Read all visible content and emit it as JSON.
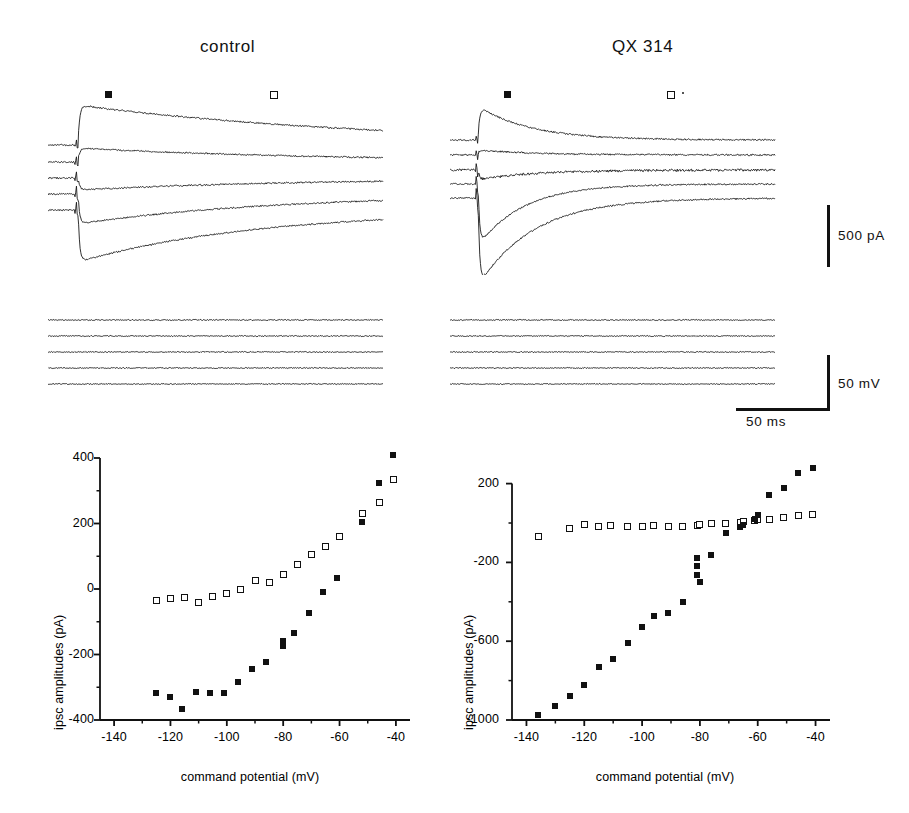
{
  "figure": {
    "cut_header_text": "",
    "panels": [
      {
        "id": "control",
        "title": "control"
      },
      {
        "id": "qx314",
        "title": "QX 314"
      }
    ],
    "markers": {
      "filled_label": "filled-square-marker",
      "open_label": "open-square-marker"
    },
    "scalebars": [
      {
        "name": "current-scalebar",
        "label": "500 pA",
        "orientation": "vertical"
      },
      {
        "name": "voltage-scalebar",
        "label": "50 mV",
        "orientation": "vertical"
      },
      {
        "name": "time-scalebar",
        "label": "50 ms",
        "orientation": "horizontal"
      }
    ]
  },
  "chart_data": [
    {
      "type": "scatter",
      "panel": "control",
      "title": "control",
      "xlabel": "command potential (mV)",
      "ylabel": "ipsc amplitudes (pA)",
      "xlim": [
        -145,
        -35
      ],
      "ylim": [
        -400,
        400
      ],
      "xticks": [
        -140,
        -120,
        -100,
        -80,
        -60,
        -40
      ],
      "xticklabels": [
        "-140",
        "-120",
        "-100",
        "-80",
        "-60",
        "-40"
      ],
      "yticks": [
        -400,
        -200,
        0,
        200,
        400
      ],
      "yticklabels": [
        "-400",
        "-200",
        "0",
        "200",
        "400"
      ],
      "yminorticks": [
        -300,
        -100,
        100,
        300
      ],
      "xminorticks": [
        -130,
        -110,
        -90,
        -70,
        -50
      ],
      "grid": false,
      "legend": false,
      "series": [
        {
          "name": "open-square-series",
          "marker": "open square",
          "x": [
            -125,
            -120,
            -115,
            -110,
            -105,
            -100,
            -95,
            -90,
            -85,
            -80,
            -75,
            -70,
            -65,
            -60,
            -52,
            -46,
            -41
          ],
          "y": [
            -35,
            -28,
            -25,
            -40,
            -22,
            -15,
            0,
            25,
            20,
            45,
            75,
            105,
            130,
            160,
            230,
            265,
            333
          ]
        },
        {
          "name": "filled-square-series",
          "marker": "filled square",
          "x": [
            -125,
            -120,
            -116,
            -111,
            -106,
            -101,
            -96,
            -91,
            -86,
            -80,
            -80,
            -76,
            -71,
            -66,
            -61,
            -52,
            -46,
            -41
          ],
          "y": [
            -318,
            -330,
            -365,
            -315,
            -318,
            -317,
            -285,
            -245,
            -222,
            -160,
            -175,
            -133,
            -73,
            -10,
            35,
            205,
            325,
            408
          ]
        }
      ]
    },
    {
      "type": "scatter",
      "panel": "qx314",
      "title": "QX 314",
      "xlabel": "command potential (mV)",
      "ylabel": "ipsc amplitudes (pA)",
      "xlim": [
        -145,
        -35
      ],
      "ylim": [
        -1000,
        330
      ],
      "xticks": [
        -140,
        -120,
        -100,
        -80,
        -60,
        -40
      ],
      "xticklabels": [
        "-140",
        "-120",
        "-100",
        "-80",
        "-60",
        "-40"
      ],
      "yticks": [
        -1000,
        -600,
        -200,
        200
      ],
      "yticklabels": [
        "-1000",
        "-600",
        "-200",
        "200"
      ],
      "yminorticks": [
        -800,
        -400,
        0
      ],
      "xminorticks": [
        -130,
        -110,
        -90,
        -70,
        -50
      ],
      "grid": false,
      "legend": false,
      "series": [
        {
          "name": "open-square-series",
          "marker": "open square",
          "x": [
            -136,
            -125,
            -120,
            -115,
            -111,
            -105,
            -100,
            -96,
            -91,
            -86,
            -81,
            -80,
            -76,
            -71,
            -66,
            -65,
            -61,
            -60,
            -56,
            -51,
            -46,
            -41
          ],
          "y": [
            -70,
            -30,
            -10,
            -18,
            -15,
            -20,
            -18,
            -15,
            -20,
            -18,
            -12,
            -8,
            0,
            0,
            5,
            8,
            15,
            20,
            18,
            28,
            38,
            45
          ]
        },
        {
          "name": "filled-square-series",
          "marker": "filled square",
          "x": [
            -136,
            -130,
            -125,
            -120,
            -115,
            -110,
            -105,
            -100,
            -96,
            -91,
            -86,
            -81,
            -81,
            -81,
            -80,
            -76,
            -71,
            -66,
            -65,
            -61,
            -60,
            -56,
            -51,
            -46,
            -41
          ],
          "y": [
            -975,
            -930,
            -880,
            -820,
            -730,
            -690,
            -610,
            -530,
            -470,
            -455,
            -400,
            -265,
            -220,
            -180,
            -300,
            -160,
            -50,
            -20,
            -8,
            20,
            40,
            140,
            180,
            255,
            280
          ]
        }
      ]
    }
  ],
  "traces": {
    "control_current": {
      "name": "control-current-traces",
      "n_traces": 5
    },
    "qx_current": {
      "name": "qx314-current-traces",
      "n_traces": 5
    },
    "control_voltage": {
      "name": "control-voltage-traces",
      "n_traces": 5
    },
    "qx_voltage": {
      "name": "qx314-voltage-traces",
      "n_traces": 5
    }
  }
}
